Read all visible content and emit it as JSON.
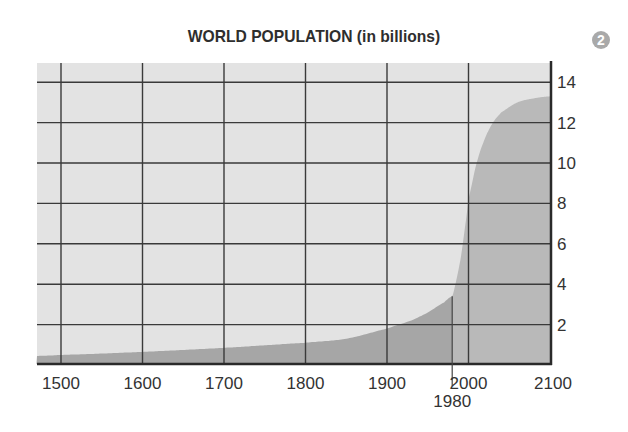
{
  "badge": "2",
  "chart_data": {
    "type": "area",
    "title": "WORLD POPULATION (in billions)",
    "xlabel": "",
    "ylabel": "",
    "xlim": [
      1470,
      2100
    ],
    "ylim": [
      0,
      15
    ],
    "grid": true,
    "y_axis_position": "right",
    "x_ticks": [
      1500,
      1600,
      1700,
      1800,
      1900,
      2000,
      2100
    ],
    "y_ticks": [
      2,
      4,
      6,
      8,
      10,
      12,
      14
    ],
    "annotations": [
      {
        "x": 1980,
        "label": "1980",
        "type": "vertical-marker"
      }
    ],
    "series": [
      {
        "name": "Historical",
        "style": "dark-fill",
        "x": [
          1470,
          1500,
          1600,
          1700,
          1800,
          1850,
          1900,
          1930,
          1950,
          1970,
          1980
        ],
        "values": [
          0.45,
          0.5,
          0.65,
          0.85,
          1.1,
          1.3,
          1.8,
          2.2,
          2.6,
          3.1,
          3.4
        ]
      },
      {
        "name": "Projected",
        "style": "light-fill",
        "x": [
          1980,
          1985,
          1990,
          1995,
          2000,
          2010,
          2020,
          2030,
          2040,
          2060,
          2080,
          2100
        ],
        "values": [
          3.4,
          4.2,
          5.2,
          6.6,
          8.2,
          10.0,
          11.2,
          12.0,
          12.5,
          13.0,
          13.2,
          13.3
        ]
      }
    ]
  }
}
